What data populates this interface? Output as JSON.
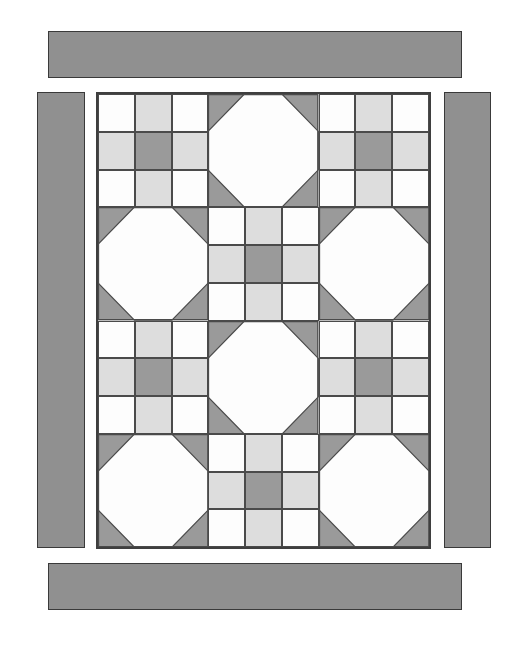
{
  "artwork": {
    "title": "Patchwork Quilt Block Layout",
    "canvas": {
      "width": 527,
      "height": 650,
      "background": "#ffffff"
    }
  },
  "palette": {
    "white": "#fdfdfd",
    "light_gray": "#dddddd",
    "medium_gray": "#909090",
    "dark_gray": "#9a9a9a",
    "outline": "#4a4a4a",
    "frame_outline": "#3f3f3f",
    "bar_outline": "#3a3a3a"
  },
  "borders": {
    "top": {
      "label": "top-border-strip",
      "x": 48,
      "y": 31,
      "width": 414,
      "height": 47,
      "fill": "#909090"
    },
    "bottom": {
      "label": "bottom-border-strip",
      "x": 48,
      "y": 563,
      "width": 414,
      "height": 47,
      "fill": "#909090"
    },
    "left": {
      "label": "left-border-strip",
      "x": 37,
      "y": 92,
      "width": 48,
      "height": 456,
      "fill": "#909090"
    },
    "right": {
      "label": "right-border-strip",
      "x": 444,
      "y": 92,
      "width": 47,
      "height": 456,
      "fill": "#909090"
    }
  },
  "center": {
    "label": "quilt-center-panel",
    "x": 96,
    "y": 92,
    "width": 335,
    "height": 457,
    "columns": 3,
    "rows": 4
  },
  "blocks": [
    {
      "row": 1,
      "col": 1,
      "type": "nine-patch"
    },
    {
      "row": 1,
      "col": 2,
      "type": "snowball"
    },
    {
      "row": 1,
      "col": 3,
      "type": "nine-patch"
    },
    {
      "row": 2,
      "col": 1,
      "type": "snowball"
    },
    {
      "row": 2,
      "col": 2,
      "type": "nine-patch"
    },
    {
      "row": 2,
      "col": 3,
      "type": "snowball"
    },
    {
      "row": 3,
      "col": 1,
      "type": "nine-patch"
    },
    {
      "row": 3,
      "col": 2,
      "type": "snowball"
    },
    {
      "row": 3,
      "col": 3,
      "type": "nine-patch"
    },
    {
      "row": 4,
      "col": 1,
      "type": "snowball"
    },
    {
      "row": 4,
      "col": 2,
      "type": "nine-patch"
    },
    {
      "row": 4,
      "col": 3,
      "type": "snowball"
    }
  ],
  "nine_patch_pattern": [
    [
      "white",
      "light_gray",
      "white"
    ],
    [
      "light_gray",
      "dark_gray",
      "light_gray"
    ],
    [
      "white",
      "light_gray",
      "white"
    ]
  ],
  "snowball_pattern": {
    "center_fill": "white",
    "corner_fill": "dark_gray",
    "corner_ratio": 0.33
  }
}
